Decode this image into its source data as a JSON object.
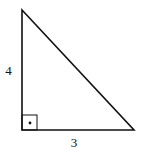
{
  "diagram": {
    "type": "right-triangle",
    "vertices": {
      "top": [
        22,
        10
      ],
      "right_angle": [
        22,
        130
      ],
      "bottom_right": [
        134,
        130
      ]
    },
    "labels": {
      "vertical_leg": "4",
      "horizontal_leg": "3"
    },
    "right_angle_marker": {
      "has_dot": true
    },
    "colors": {
      "stroke": "#111111",
      "background": "#ffffff"
    }
  }
}
